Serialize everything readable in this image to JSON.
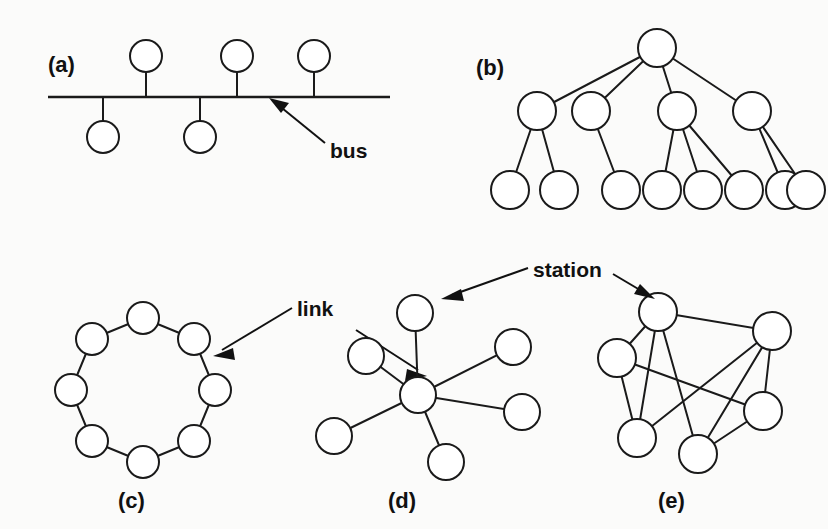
{
  "figure": {
    "background_color": "#fbfbfa",
    "line_color": "#1a1a1a",
    "node_fill": "#ffffff"
  },
  "panels": [
    {
      "id": "bus",
      "label": "(a)",
      "topology": "bus",
      "label_x": 48,
      "label_y": 72,
      "node_count": 6,
      "description": "Bus topology: horizontal bus line with stations tapped above and below"
    },
    {
      "id": "tree",
      "label": "(b)",
      "topology": "tree",
      "label_x": 476,
      "label_y": 75,
      "node_count": 13,
      "description": "Tree topology: one root, four second-level nodes, eight leaf nodes"
    },
    {
      "id": "ring",
      "label": "(c)",
      "topology": "ring",
      "label_x": 118,
      "label_y": 508,
      "node_count": 8,
      "description": "Ring topology: eight stations joined in a closed loop"
    },
    {
      "id": "star",
      "label": "(d)",
      "topology": "star",
      "label_x": 388,
      "label_y": 508,
      "node_count": 7,
      "description": "Star topology: central hub with six stations"
    },
    {
      "id": "mesh",
      "label": "(e)",
      "topology": "mesh",
      "label_x": 658,
      "label_y": 508,
      "node_count": 6,
      "description": "Mesh topology: six stations with multiple interconnecting links"
    }
  ],
  "annotations": [
    {
      "id": "bus-annotation",
      "text": "bus",
      "text_x": 330,
      "text_y": 158,
      "points_to": "bus-line"
    },
    {
      "id": "link-annotation",
      "text": "link",
      "text_x": 297,
      "text_y": 316,
      "points_to": "ring-edge-and-star-spoke"
    },
    {
      "id": "station-annotation",
      "text": "station",
      "text_x": 533,
      "text_y": 277,
      "points_to": "star-node-and-mesh-node"
    }
  ],
  "bus_panel": {
    "line_start_x": 48,
    "line_end_x": 390,
    "line_y": 97,
    "nodes_above": [
      {
        "x": 146,
        "y": 56,
        "r": 16
      },
      {
        "x": 237,
        "y": 56,
        "r": 16
      },
      {
        "x": 314,
        "y": 56,
        "r": 16
      }
    ],
    "nodes_below": [
      {
        "x": 103,
        "y": 137,
        "r": 16
      },
      {
        "x": 200,
        "y": 137,
        "r": 16
      }
    ]
  },
  "tree_panel": {
    "root": {
      "x": 657,
      "y": 48,
      "r": 19
    },
    "level2": [
      {
        "x": 537,
        "y": 111,
        "r": 19,
        "children": 2
      },
      {
        "x": 591,
        "y": 111,
        "r": 19,
        "children": 1
      },
      {
        "x": 677,
        "y": 111,
        "r": 19,
        "children": 3
      },
      {
        "x": 752,
        "y": 111,
        "r": 19,
        "children": 2
      }
    ],
    "leaves": [
      {
        "x": 510,
        "y": 190,
        "r": 19
      },
      {
        "x": 559,
        "y": 190,
        "r": 19
      },
      {
        "x": 621,
        "y": 190,
        "r": 19
      },
      {
        "x": 662,
        "y": 190,
        "r": 19
      },
      {
        "x": 703,
        "y": 190,
        "r": 19
      },
      {
        "x": 744,
        "y": 190,
        "r": 19
      },
      {
        "x": 785,
        "y": 190,
        "r": 19
      },
      {
        "x": 806,
        "y": 190,
        "r": 19
      }
    ]
  },
  "ring_panel": {
    "center_x": 143,
    "center_y": 390,
    "radius": 72,
    "node_radius": 16,
    "node_count": 8,
    "start_angle_deg": -90
  },
  "star_panel": {
    "hub": {
      "x": 418,
      "y": 395,
      "r": 18
    },
    "spokes": [
      {
        "x": 415,
        "y": 313,
        "r": 18
      },
      {
        "x": 513,
        "y": 347,
        "r": 18
      },
      {
        "x": 522,
        "y": 412,
        "r": 18
      },
      {
        "x": 446,
        "y": 462,
        "r": 18
      },
      {
        "x": 334,
        "y": 436,
        "r": 18
      },
      {
        "x": 366,
        "y": 356,
        "r": 18
      }
    ]
  },
  "mesh_panel": {
    "nodes": [
      {
        "id": "A",
        "x": 658,
        "y": 312,
        "r": 19
      },
      {
        "id": "B",
        "x": 772,
        "y": 331,
        "r": 19
      },
      {
        "id": "C",
        "x": 617,
        "y": 358,
        "r": 19
      },
      {
        "id": "D",
        "x": 763,
        "y": 411,
        "r": 19
      },
      {
        "id": "E",
        "x": 637,
        "y": 438,
        "r": 19
      },
      {
        "id": "F",
        "x": 698,
        "y": 454,
        "r": 19
      }
    ],
    "edges": [
      [
        "A",
        "B"
      ],
      [
        "A",
        "C"
      ],
      [
        "A",
        "E"
      ],
      [
        "A",
        "F"
      ],
      [
        "B",
        "D"
      ],
      [
        "B",
        "E"
      ],
      [
        "B",
        "F"
      ],
      [
        "C",
        "E"
      ],
      [
        "C",
        "D"
      ],
      [
        "D",
        "F"
      ]
    ]
  }
}
